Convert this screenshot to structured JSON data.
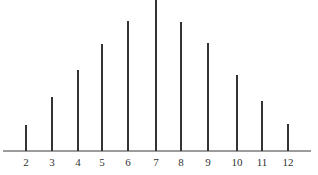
{
  "chart_data": {
    "type": "bar",
    "title": "",
    "xlabel": "",
    "ylabel": "",
    "categories": [
      "2",
      "3",
      "4",
      "5",
      "6",
      "7",
      "8",
      "9",
      "10",
      "11",
      "12"
    ],
    "values": [
      1,
      2,
      3,
      4,
      5,
      6,
      5,
      4,
      3,
      2,
      1
    ],
    "ylim": [
      0,
      6
    ],
    "grid": false,
    "legend": null,
    "style": "spike / line bars on a horizontal axis, no y-axis",
    "note": "Distribution of the sum of two dice (counts out of 36)"
  },
  "layout": {
    "baseline_y": 151,
    "axis_x_start": 3,
    "axis_x_end": 311,
    "label_y": 166,
    "bar_x": [
      26,
      52,
      78,
      102,
      128,
      156,
      181,
      208,
      237,
      262,
      288
    ],
    "bar_top_y": [
      125,
      97,
      70,
      44,
      21,
      0,
      22,
      43,
      75,
      101,
      124
    ]
  }
}
